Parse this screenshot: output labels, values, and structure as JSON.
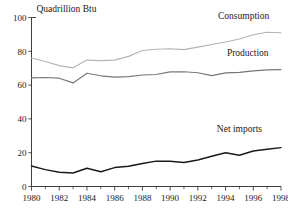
{
  "chart_data": {
    "type": "line",
    "title": "",
    "subtitle": "",
    "xlabel": "",
    "ylabel": "Quadrillion Btu",
    "ylim": [
      0,
      100
    ],
    "xlim": [
      1980,
      1998
    ],
    "grid": false,
    "legend_position": "inline-labels",
    "y_ticks": [
      0,
      20,
      40,
      60,
      80,
      100
    ],
    "y_tick_labels": [
      "0",
      "20",
      "40",
      "60",
      "80",
      "100"
    ],
    "x_ticks": [
      1980,
      1982,
      1984,
      1986,
      1988,
      1990,
      1992,
      1994,
      1996,
      1998
    ],
    "x_tick_labels": [
      "1980",
      "1982",
      "1984",
      "1986",
      "1988",
      "1990",
      "1992",
      "1994",
      "1996",
      "1998"
    ],
    "x_minor_ticks": [
      1981,
      1983,
      1985,
      1987,
      1989,
      1991,
      1993,
      1995,
      1997
    ],
    "x": [
      1980,
      1981,
      1982,
      1983,
      1984,
      1985,
      1986,
      1987,
      1988,
      1989,
      1990,
      1991,
      1992,
      1993,
      1994,
      1995,
      1996,
      1997,
      1998
    ],
    "series": [
      {
        "name": "Consumption",
        "color": "#b4b4b4",
        "values": [
          76.0,
          74.0,
          71.5,
          70.2,
          74.8,
          74.5,
          74.8,
          77.0,
          80.5,
          81.2,
          81.5,
          81.0,
          82.5,
          84.0,
          85.5,
          87.3,
          89.8,
          91.3,
          91.0
        ]
      },
      {
        "name": "Production",
        "color": "#777777",
        "values": [
          64.3,
          64.5,
          64.1,
          61.3,
          67.0,
          65.5,
          64.7,
          65.0,
          66.0,
          66.3,
          67.8,
          67.9,
          67.3,
          65.6,
          67.2,
          67.5,
          68.4,
          69.0,
          69.2
        ]
      },
      {
        "name": "Net imports",
        "color": "#1a1a1a",
        "values": [
          12.1,
          10.0,
          8.4,
          8.0,
          10.8,
          8.7,
          11.2,
          12.0,
          13.6,
          15.0,
          14.9,
          14.2,
          15.7,
          17.9,
          20.0,
          18.5,
          21.0,
          22.0,
          23.0
        ]
      }
    ],
    "annotations": [
      {
        "text": "Consumption",
        "x": 1995.3,
        "y": 99.0
      },
      {
        "text": "Production",
        "x": 1995.6,
        "y": 77.0
      },
      {
        "text": "Net imports",
        "x": 1995.0,
        "y": 32.0
      }
    ]
  }
}
